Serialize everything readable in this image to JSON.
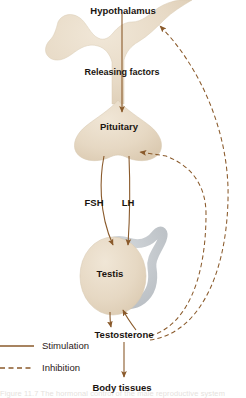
{
  "figure": {
    "caption_partial": "Figure  11.7   The hormonal control of the male reproductive system"
  },
  "colors": {
    "organ_fill": "#e5d7c2",
    "organ_fill_light": "#ece0ce",
    "duct_grey": "#b6bbc0",
    "stimulation_line": "#8a5a2b",
    "inhibition_line": "#8a5a2b",
    "text": "#1a1410",
    "background": "#ffffff"
  },
  "nodes": [
    {
      "id": "hypothalamus",
      "label": "Hypothalamus",
      "x": 123,
      "y": 11
    },
    {
      "id": "pituitary",
      "label": "Pituitary",
      "x": 119,
      "y": 127
    },
    {
      "id": "testis",
      "label": "Testis",
      "x": 110,
      "y": 274
    },
    {
      "id": "testosterone",
      "label": "Testosterone",
      "x": 124,
      "y": 335
    },
    {
      "id": "body_tissues",
      "label": "Body tissues",
      "x": 122,
      "y": 388
    }
  ],
  "edge_labels": [
    {
      "id": "releasing-factors",
      "label": "Releasing  factors",
      "x": 122,
      "y": 73
    },
    {
      "id": "fsh",
      "label": "FSH",
      "x": 94,
      "y": 203
    },
    {
      "id": "lh",
      "label": "LH",
      "x": 128,
      "y": 203
    }
  ],
  "legend": {
    "items": [
      {
        "id": "stimulation",
        "label": "Stimulation",
        "style": "solid",
        "color": "#8a5a2b"
      },
      {
        "id": "inhibition",
        "label": "Inhibition",
        "style": "dashed",
        "color": "#8a5a2b"
      }
    ]
  },
  "relationships": [
    {
      "from": "hypothalamus",
      "to": "pituitary",
      "type": "stimulation",
      "label": "Releasing  factors"
    },
    {
      "from": "pituitary",
      "to": "testis",
      "type": "stimulation",
      "label": "FSH"
    },
    {
      "from": "pituitary",
      "to": "testis",
      "type": "stimulation",
      "label": "LH"
    },
    {
      "from": "testis",
      "to": "testosterone",
      "type": "stimulation",
      "label": ""
    },
    {
      "from": "testosterone",
      "to": "body_tissues",
      "type": "stimulation",
      "label": ""
    },
    {
      "from": "testosterone",
      "to": "testis",
      "type": "stimulation",
      "label": ""
    },
    {
      "from": "testosterone",
      "to": "hypothalamus",
      "type": "inhibition",
      "label": ""
    },
    {
      "from": "testosterone",
      "to": "pituitary",
      "type": "inhibition",
      "label": ""
    }
  ]
}
